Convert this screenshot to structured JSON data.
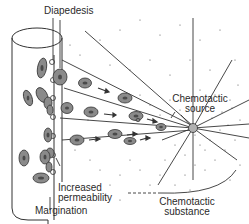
{
  "diagram": {
    "labels": {
      "diapedesis": "Diapedesis",
      "chemotactic_source_line1": "Chemotactic",
      "chemotactic_source_line2": "source",
      "increased_permeability_line1": "Increased",
      "increased_permeability_line2": "permeability",
      "margination": "Margination",
      "chemotactic_substance_line1": "Chemotactic",
      "chemotactic_substance_line2": "substance"
    },
    "colors": {
      "line": "#333333",
      "cell_fill": "#8a8a8a",
      "nucleus_fill": "#5a5a5a",
      "source_fill": "#b0b0b0",
      "background": "#ffffff"
    }
  }
}
